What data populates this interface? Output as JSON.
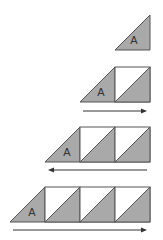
{
  "diagram": {
    "colors": {
      "fill": "#a9a9a9",
      "stroke": "#555555",
      "background": "#ffffff",
      "arrow": "#333333"
    },
    "label": "A",
    "rows": [
      {
        "units": 0,
        "arrow": "none"
      },
      {
        "units": 1,
        "arrow": "right"
      },
      {
        "units": 2,
        "arrow": "left"
      },
      {
        "units": 3,
        "arrow": "right"
      }
    ]
  }
}
